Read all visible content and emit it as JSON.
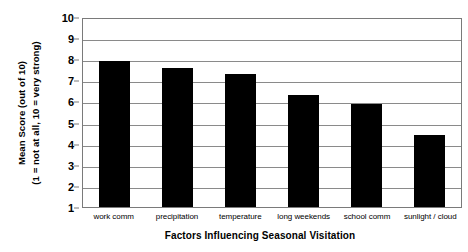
{
  "chart_data": {
    "type": "bar",
    "title": "",
    "xlabel": "Factors Influencing Seasonal Visitation",
    "ylabel_line1": "Mean Score (out of 10)",
    "ylabel_line2": "(1 = not at all, 10 = very strong)",
    "categories": [
      "work comm",
      "precipitation",
      "temperature",
      "long weekends",
      "school comm",
      "sunlight / cloud"
    ],
    "values": [
      7.9,
      7.6,
      7.3,
      6.3,
      5.9,
      4.4
    ],
    "ylim": [
      1,
      10
    ],
    "yticks": [
      10,
      9,
      8,
      7,
      6,
      5,
      4,
      3,
      2,
      1
    ],
    "ytick_labels": [
      "10",
      "9",
      "8",
      "7",
      "6",
      "5",
      "4",
      "3",
      "2",
      "1"
    ],
    "grid": true,
    "legend": false,
    "bar_color": "#000000",
    "grid_color": "#8a8a8a",
    "axis_color": "#7a7a7a",
    "background": "#ffffff"
  }
}
